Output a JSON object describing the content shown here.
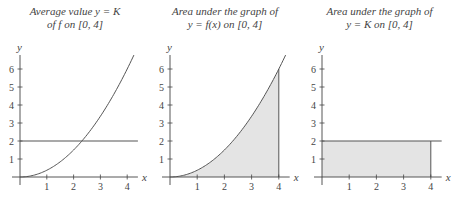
{
  "chart_data": [
    {
      "type": "line",
      "title": [
        "Average value y = K",
        "of f on [0, 4]"
      ],
      "xlabel": "x",
      "ylabel": "y",
      "x_ticks": [
        1,
        2,
        3,
        4
      ],
      "y_ticks": [
        1,
        2,
        3,
        4,
        5,
        6
      ],
      "xlim": [
        0,
        4.4
      ],
      "ylim": [
        0,
        6.8
      ],
      "series": [
        {
          "name": "f(x) = (3/8)x^2",
          "x": [
            0,
            0.5,
            1,
            1.5,
            2,
            2.5,
            3,
            3.5,
            4,
            4.27
          ],
          "values": [
            0,
            0.09,
            0.375,
            0.84,
            1.5,
            2.34,
            3.375,
            4.59,
            6,
            6.84
          ]
        },
        {
          "name": "y = K",
          "x": [
            0,
            4.4
          ],
          "values": [
            2,
            2
          ]
        }
      ],
      "shaded_region": null,
      "grid": false
    },
    {
      "type": "area",
      "title": [
        "Area under the graph of",
        "y = f(x) on [0, 4]"
      ],
      "xlabel": "x",
      "ylabel": "y",
      "x_ticks": [
        1,
        2,
        3,
        4
      ],
      "y_ticks": [
        1,
        2,
        3,
        4,
        5,
        6
      ],
      "xlim": [
        0,
        4.4
      ],
      "ylim": [
        0,
        6.8
      ],
      "series": [
        {
          "name": "f(x) = (3/8)x^2",
          "x": [
            0,
            0.5,
            1,
            1.5,
            2,
            2.5,
            3,
            3.5,
            4,
            4.27
          ],
          "values": [
            0,
            0.09,
            0.375,
            0.84,
            1.5,
            2.34,
            3.375,
            4.59,
            6,
            6.84
          ]
        }
      ],
      "shaded_region": {
        "under": "f(x)",
        "from": 0,
        "to": 4
      },
      "grid": false
    },
    {
      "type": "area",
      "title": [
        "Area under the graph of",
        "y = K on [0, 4]"
      ],
      "xlabel": "x",
      "ylabel": "y",
      "x_ticks": [
        1,
        2,
        3,
        4
      ],
      "y_ticks": [
        1,
        2,
        3,
        4,
        5,
        6
      ],
      "xlim": [
        0,
        4.4
      ],
      "ylim": [
        0,
        6.8
      ],
      "series": [
        {
          "name": "y = K",
          "x": [
            0,
            4.4
          ],
          "values": [
            2,
            2
          ]
        }
      ],
      "shaded_region": {
        "under": "y = K",
        "from": 0,
        "to": 4
      },
      "grid": false
    }
  ],
  "panels": [
    {
      "title_line1": "Average value y = K",
      "title_line2": "of f on [0, 4]"
    },
    {
      "title_line1": "Area under the graph of",
      "title_line2": "y = f(x) on [0, 4]"
    },
    {
      "title_line1": "Area under the graph of",
      "title_line2": "y = K on [0, 4]"
    }
  ],
  "axis": {
    "xlabel": "x",
    "ylabel": "y",
    "x_tick_labels": [
      "1",
      "2",
      "3",
      "4"
    ],
    "y_tick_labels": [
      "1",
      "2",
      "3",
      "4",
      "5",
      "6"
    ]
  },
  "colors": {
    "line": "#555555",
    "axis": "#444444",
    "shade": "#e4e4e4"
  }
}
